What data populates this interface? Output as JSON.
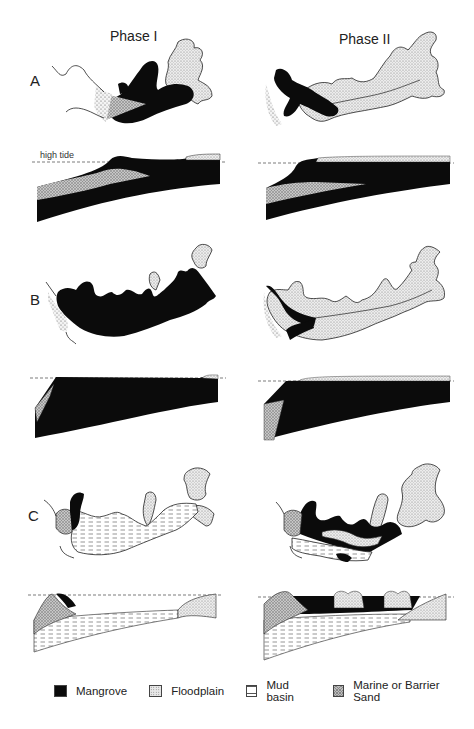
{
  "figure": {
    "columns": [
      {
        "id": "phase-1",
        "title": "Phase I"
      },
      {
        "id": "phase-2",
        "title": "Phase II"
      }
    ],
    "rows": [
      {
        "id": "A",
        "label": "A"
      },
      {
        "id": "B",
        "label": "B"
      },
      {
        "id": "C",
        "label": "C"
      }
    ],
    "annotations": {
      "high_tide": "high tide"
    },
    "legend": [
      {
        "id": "mangrove",
        "label": "Mangrove",
        "pattern": "solid-black",
        "color": "#0b0b0b"
      },
      {
        "id": "floodplain",
        "label": "Floodplain",
        "pattern": "fine-stipple",
        "color": "#e8e8e8"
      },
      {
        "id": "mud-basin",
        "label": "Mud basin",
        "pattern": "horizontal-dashes",
        "color": "#ffffff"
      },
      {
        "id": "marine-sand",
        "label": "Marine or Barrier Sand",
        "pattern": "cross-hatch",
        "color": "#bdbdbd"
      }
    ]
  }
}
